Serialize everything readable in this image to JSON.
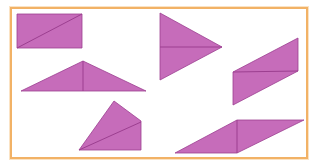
{
  "figure": {
    "colors": {
      "fill": "#c66cba",
      "stroke": "#9c3f90",
      "border": "#f2b266",
      "background": "#ffffff"
    },
    "shapes": [
      {
        "name": "rectangle",
        "points": "17,14 82,14 82,48 17,48",
        "divider": "17,48 82,14"
      },
      {
        "name": "right-pointing-triangle",
        "points": "160,13 222,47 160,80",
        "divider": "160,47 222,47"
      },
      {
        "name": "wide-isosceles-triangle",
        "points": "83,61 146,91 21,91",
        "divider": "83,61 83,91"
      },
      {
        "name": "slanted-parallelogram",
        "points": "233,72 298,38 298,71 233,105",
        "divider": "233,72 298,71"
      },
      {
        "name": "quadrilateral",
        "points": "114,101 141,121 141,150 79,150",
        "divider": "79,150 141,122"
      },
      {
        "name": "flat-parallelogram",
        "points": "237,120 304,120 237,153 175,153",
        "divider": "237,120 237,153"
      }
    ]
  }
}
